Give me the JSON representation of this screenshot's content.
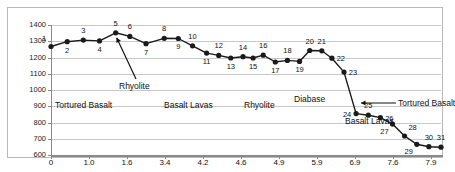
{
  "chart_data": {
    "type": "line",
    "title": "",
    "subtitle": "",
    "xlabel": "",
    "ylabel": "",
    "xlim": [
      0,
      7.9
    ],
    "ylim": [
      600,
      1400
    ],
    "grid": true,
    "legend_position": "none",
    "y_ticks": [
      600,
      700,
      800,
      900,
      1000,
      1100,
      1200,
      1300,
      1400
    ],
    "y_tick_labels": [
      "600",
      "700",
      "800",
      "900",
      "1000",
      "1100",
      "1200",
      "1300",
      "1400"
    ],
    "x_ticks": [
      0,
      1.0,
      1.6,
      3.4,
      4.2,
      4.6,
      4.9,
      5.9,
      6.9,
      7.6,
      7.9
    ],
    "x_tick_labels": [
      "0",
      "1.0",
      "1.6",
      "3.4",
      "4.2",
      "4.6",
      "4.9",
      "5.9",
      "6.9",
      "7.6",
      "7.9"
    ],
    "series": [
      {
        "name": "depth-profile",
        "color": "#1a1a1a",
        "marker": "circle",
        "point_labels": [
          "1",
          "2",
          "3",
          "4",
          "5",
          "6",
          "7",
          "8",
          "9",
          "10",
          "11",
          "12",
          "13",
          "14",
          "15",
          "16",
          "17",
          "18",
          "19",
          "20",
          "21",
          "22",
          "23",
          "24",
          "25",
          "26",
          "27",
          "28",
          "29",
          "30",
          "31"
        ],
        "points": [
          {
            "label": "1",
            "x": 0.0,
            "y": 1268,
            "label_pos": "above-left"
          },
          {
            "label": "2",
            "x": 0.4,
            "y": 1297,
            "label_pos": "below"
          },
          {
            "label": "3",
            "x": 0.8,
            "y": 1307,
            "label_pos": "above"
          },
          {
            "label": "4",
            "x": 1.2,
            "y": 1302,
            "label_pos": "below"
          },
          {
            "label": "5",
            "x": 1.6,
            "y": 1352,
            "label_pos": "above"
          },
          {
            "label": "6",
            "x": 1.95,
            "y": 1330,
            "label_pos": "above"
          },
          {
            "label": "7",
            "x": 2.35,
            "y": 1285,
            "label_pos": "below"
          },
          {
            "label": "8",
            "x": 2.8,
            "y": 1318,
            "label_pos": "above"
          },
          {
            "label": "9",
            "x": 3.15,
            "y": 1317,
            "label_pos": "below"
          },
          {
            "label": "10",
            "x": 3.5,
            "y": 1272,
            "label_pos": "above"
          },
          {
            "label": "11",
            "x": 3.85,
            "y": 1227,
            "label_pos": "below"
          },
          {
            "label": "12",
            "x": 4.15,
            "y": 1213,
            "label_pos": "above"
          },
          {
            "label": "13",
            "x": 4.45,
            "y": 1197,
            "label_pos": "below"
          },
          {
            "label": "14",
            "x": 4.75,
            "y": 1205,
            "label_pos": "above"
          },
          {
            "label": "15",
            "x": 5.0,
            "y": 1197,
            "label_pos": "below"
          },
          {
            "label": "16",
            "x": 5.25,
            "y": 1214,
            "label_pos": "above"
          },
          {
            "label": "17",
            "x": 5.55,
            "y": 1172,
            "label_pos": "below"
          },
          {
            "label": "18",
            "x": 5.85,
            "y": 1182,
            "label_pos": "above"
          },
          {
            "label": "19",
            "x": 6.15,
            "y": 1176,
            "label_pos": "below"
          },
          {
            "label": "20",
            "x": 6.4,
            "y": 1243,
            "label_pos": "above"
          },
          {
            "label": "21",
            "x": 6.7,
            "y": 1241,
            "label_pos": "above"
          },
          {
            "label": "22",
            "x": 6.95,
            "y": 1196,
            "label_pos": "right"
          },
          {
            "label": "23",
            "x": 7.25,
            "y": 1110,
            "label_pos": "right"
          },
          {
            "label": "24",
            "x": 7.55,
            "y": 855,
            "label_pos": "left"
          },
          {
            "label": "25",
            "x": 7.85,
            "y": 845,
            "label_pos": "above"
          },
          {
            "label": "26",
            "x": 8.15,
            "y": 830,
            "label_pos": "right"
          },
          {
            "label": "27",
            "x": 8.45,
            "y": 790,
            "label_pos": "below-left"
          },
          {
            "label": "28",
            "x": 8.75,
            "y": 717,
            "label_pos": "above-right"
          },
          {
            "label": "29",
            "x": 9.05,
            "y": 666,
            "label_pos": "below-left"
          },
          {
            "label": "30",
            "x": 9.35,
            "y": 651,
            "label_pos": "above"
          },
          {
            "label": "31",
            "x": 9.65,
            "y": 648,
            "label_pos": "above"
          }
        ]
      }
    ],
    "annotations": [
      {
        "name": "band-tortured-basalt-left",
        "text": "Tortured Basalt",
        "kind": "band-label"
      },
      {
        "name": "band-basalt-lavas-mid",
        "text": "Basalt Lavas",
        "kind": "band-label"
      },
      {
        "name": "band-rhyolite-mid",
        "text": "Rhyolite",
        "kind": "band-label"
      },
      {
        "name": "band-diabase",
        "text": "Diabase",
        "kind": "band-label"
      },
      {
        "name": "band-basalt-lavas-right",
        "text": "Basalt Lavas",
        "kind": "band-label"
      },
      {
        "name": "callout-rhyolite-peak",
        "text": "Rhyolite",
        "kind": "arrow-callout"
      },
      {
        "name": "callout-tortured-basalt-right",
        "text": "Tortured Basalt",
        "kind": "arrow-callout"
      }
    ],
    "colors": {
      "line": "#1a1a1a",
      "marker": "#1a1a1a",
      "grid": "#c8c8c8",
      "axis": "#8a8a8a",
      "frame": "#b9b9b9",
      "text": "#111111",
      "background": "#ffffff"
    }
  },
  "labels": {
    "tortured_basalt_left": "Tortured Basalt",
    "basalt_lavas_mid": "Basalt Lavas",
    "rhyolite_mid": "Rhyolite",
    "diabase": "Diabase",
    "basalt_lavas_right": "Basalt Lavas",
    "rhyolite_callout": "Rhyolite",
    "tortured_basalt_callout": "Tortured Basalt"
  }
}
